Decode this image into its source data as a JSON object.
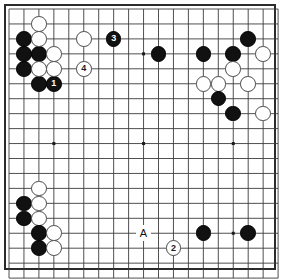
{
  "board": {
    "title": "Go board diagram",
    "size": 19,
    "visible_columns": 18,
    "visible_rows": 18,
    "line_color": "#3c3c3c",
    "border_color": "#2b2b2b",
    "background_color": "#ffffff",
    "black_color": "#111111",
    "white_color": "#ffffff",
    "origin_x": 9,
    "origin_y": 9,
    "step": 14.95,
    "star_points": [
      {
        "col": 3,
        "row": 3
      },
      {
        "col": 9,
        "row": 3
      },
      {
        "col": 15,
        "row": 3
      },
      {
        "col": 3,
        "row": 9
      },
      {
        "col": 9,
        "row": 9
      },
      {
        "col": 15,
        "row": 9
      },
      {
        "col": 3,
        "row": 15
      },
      {
        "col": 9,
        "row": 15
      },
      {
        "col": 15,
        "row": 15
      }
    ],
    "stones": [
      {
        "col": 1,
        "row": 2,
        "color": "black",
        "label": ""
      },
      {
        "col": 1,
        "row": 3,
        "color": "black",
        "label": ""
      },
      {
        "col": 1,
        "row": 4,
        "color": "black",
        "label": ""
      },
      {
        "col": 2,
        "row": 3,
        "color": "black",
        "label": ""
      },
      {
        "col": 2,
        "row": 5,
        "color": "black",
        "label": ""
      },
      {
        "col": 3,
        "row": 5,
        "color": "black",
        "label": "1"
      },
      {
        "col": 2,
        "row": 1,
        "color": "white",
        "label": ""
      },
      {
        "col": 2,
        "row": 2,
        "color": "white",
        "label": ""
      },
      {
        "col": 2,
        "row": 4,
        "color": "white",
        "label": ""
      },
      {
        "col": 3,
        "row": 3,
        "color": "white",
        "label": ""
      },
      {
        "col": 3,
        "row": 4,
        "color": "white",
        "label": ""
      },
      {
        "col": 5,
        "row": 2,
        "color": "white",
        "label": ""
      },
      {
        "col": 7,
        "row": 2,
        "color": "black",
        "label": "3"
      },
      {
        "col": 5,
        "row": 4,
        "color": "white",
        "label": "4"
      },
      {
        "col": 10,
        "row": 3,
        "color": "black",
        "label": ""
      },
      {
        "col": 13,
        "row": 3,
        "color": "black",
        "label": ""
      },
      {
        "col": 15,
        "row": 3,
        "color": "black",
        "label": ""
      },
      {
        "col": 16,
        "row": 2,
        "color": "black",
        "label": ""
      },
      {
        "col": 17,
        "row": 3,
        "color": "white",
        "label": ""
      },
      {
        "col": 15,
        "row": 4,
        "color": "white",
        "label": ""
      },
      {
        "col": 13,
        "row": 5,
        "color": "white",
        "label": ""
      },
      {
        "col": 14,
        "row": 5,
        "color": "white",
        "label": ""
      },
      {
        "col": 16,
        "row": 5,
        "color": "white",
        "label": ""
      },
      {
        "col": 14,
        "row": 6,
        "color": "black",
        "label": ""
      },
      {
        "col": 15,
        "row": 7,
        "color": "black",
        "label": ""
      },
      {
        "col": 17,
        "row": 7,
        "color": "white",
        "label": ""
      },
      {
        "col": 1,
        "row": 13,
        "color": "black",
        "label": ""
      },
      {
        "col": 1,
        "row": 14,
        "color": "black",
        "label": ""
      },
      {
        "col": 2,
        "row": 12,
        "color": "white",
        "label": ""
      },
      {
        "col": 2,
        "row": 13,
        "color": "white",
        "label": ""
      },
      {
        "col": 2,
        "row": 14,
        "color": "white",
        "label": ""
      },
      {
        "col": 2,
        "row": 15,
        "color": "black",
        "label": ""
      },
      {
        "col": 2,
        "row": 16,
        "color": "black",
        "label": ""
      },
      {
        "col": 3,
        "row": 15,
        "color": "white",
        "label": ""
      },
      {
        "col": 3,
        "row": 16,
        "color": "white",
        "label": ""
      },
      {
        "col": 11,
        "row": 16,
        "color": "white",
        "label": "2"
      },
      {
        "col": 13,
        "row": 15,
        "color": "black",
        "label": ""
      },
      {
        "col": 16,
        "row": 15,
        "color": "black",
        "label": ""
      }
    ],
    "point_labels": [
      {
        "col": 9,
        "row": 15,
        "text": "A"
      }
    ]
  }
}
